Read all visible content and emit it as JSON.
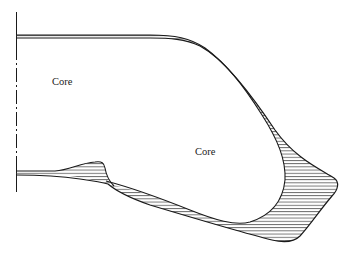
{
  "figure": {
    "type": "cross-section diagram",
    "labels": {
      "core_left": "Core",
      "core_right": "Core"
    },
    "colors": {
      "line": "#1a1a1a",
      "hatch": "#3a3a3a",
      "background": "#ffffff"
    },
    "elements": [
      "symmetry-axis (dash-dot vertical line at left)",
      "upper wall (thin double line, curving into hatched thickening)",
      "lower-left fillet bump (hatched)",
      "right bulb tip (hatched, thickest region)",
      "bottom wall (hatched, thin)"
    ]
  }
}
